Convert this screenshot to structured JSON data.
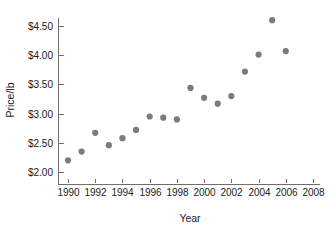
{
  "chart_data": {
    "type": "scatter",
    "title": "",
    "xlabel": "Year",
    "ylabel": "Price/lb",
    "xlim": [
      1989,
      2008.5
    ],
    "ylim": [
      1.88,
      4.72
    ],
    "grid": false,
    "legend": "none",
    "point_color": "#7b7b7b",
    "x_ticks": [
      1990,
      1992,
      1994,
      1996,
      1998,
      2000,
      2002,
      2004,
      2006,
      2008
    ],
    "x_tick_labels": [
      "1990",
      "1992",
      "1994",
      "1996",
      "1998",
      "2000",
      "2002",
      "2004",
      "2006",
      "2008"
    ],
    "y_ticks": [
      2.0,
      2.5,
      3.0,
      3.5,
      4.0,
      4.5
    ],
    "y_tick_labels": [
      "$2.00",
      "$2.50",
      "$3.00",
      "$3.50",
      "$4.00",
      "$4.50"
    ],
    "x": [
      1990,
      1991,
      1992,
      1993,
      1994,
      1995,
      1996,
      1997,
      1998,
      1999,
      2000,
      2001,
      2002,
      2003,
      2004,
      2005,
      2006
    ],
    "y": [
      2.2,
      2.35,
      2.67,
      2.46,
      2.58,
      2.72,
      2.95,
      2.93,
      2.9,
      3.44,
      3.27,
      3.17,
      3.3,
      3.72,
      4.01,
      4.6,
      4.07
    ],
    "points": [
      {
        "x": 1990,
        "y": 2.2
      },
      {
        "x": 1991,
        "y": 2.35
      },
      {
        "x": 1992,
        "y": 2.67
      },
      {
        "x": 1993,
        "y": 2.46
      },
      {
        "x": 1994,
        "y": 2.58
      },
      {
        "x": 1995,
        "y": 2.72
      },
      {
        "x": 1996,
        "y": 2.95
      },
      {
        "x": 1997,
        "y": 2.93
      },
      {
        "x": 1998,
        "y": 2.9
      },
      {
        "x": 1999,
        "y": 3.44
      },
      {
        "x": 2000,
        "y": 3.27
      },
      {
        "x": 2001,
        "y": 3.17
      },
      {
        "x": 2002,
        "y": 3.3
      },
      {
        "x": 2003,
        "y": 3.72
      },
      {
        "x": 2004,
        "y": 4.01
      },
      {
        "x": 2005,
        "y": 4.6
      },
      {
        "x": 2006,
        "y": 4.07
      }
    ]
  }
}
